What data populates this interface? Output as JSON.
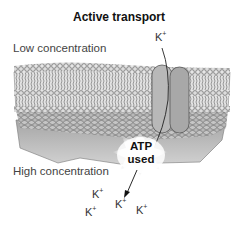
{
  "title": "Active transport",
  "labels": {
    "low": "Low concentration",
    "high": "High concentration"
  },
  "atp": {
    "line1": "ATP",
    "line2": "used"
  },
  "ions": [
    {
      "id": "top",
      "text": "K",
      "charge": "+"
    },
    {
      "id": "b1",
      "text": "K",
      "charge": "+"
    },
    {
      "id": "b2",
      "text": "K",
      "charge": "+"
    },
    {
      "id": "b3",
      "text": "K",
      "charge": "+"
    },
    {
      "id": "b4",
      "text": "K",
      "charge": "+"
    }
  ],
  "colors": {
    "membrane_head": "#d8d8d8",
    "membrane_dark": "#8a8a8a",
    "protein": "#b4b4b4",
    "cyto": "#9a9a9a"
  }
}
